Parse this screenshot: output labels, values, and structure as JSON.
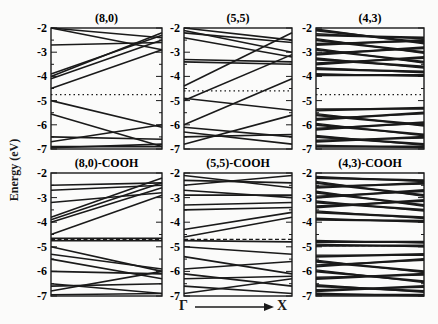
{
  "chart_data": {
    "type": "line",
    "title": "",
    "ylabel": "Energy (eV)",
    "xlabel": "Γ → X",
    "x_start_label": "Γ",
    "x_end_label": "X",
    "ylim": [
      -7,
      -2
    ],
    "yticks": [
      "-2",
      "-3",
      "-4",
      "-5",
      "-6",
      "-7"
    ],
    "grid": false,
    "panels": [
      {
        "title": "(8,0)",
        "fermi": -4.75,
        "fermi_style": "dotted",
        "bands": [
          [
            -2.7,
            -2.6
          ],
          [
            -3.9,
            -2.3
          ],
          [
            -4.0,
            -2.2
          ],
          [
            -4.1,
            -2.5
          ],
          [
            -4.5,
            -2.9
          ],
          [
            -2.0,
            -2.9
          ],
          [
            -2.0,
            -2.4
          ],
          [
            -5.0,
            -6.1
          ],
          [
            -5.55,
            -6.9
          ],
          [
            -6.5,
            -6.6
          ],
          [
            -6.7,
            -6.0
          ],
          [
            -6.9,
            -6.9
          ],
          [
            -6.95,
            -6.8
          ]
        ]
      },
      {
        "title": "(5,5)",
        "fermi": -4.6,
        "fermi_style": "dotted",
        "bands": [
          [
            -2.0,
            -2.5
          ],
          [
            -2.1,
            -3.0
          ],
          [
            -2.2,
            -2.6
          ],
          [
            -2.4,
            -3.2
          ],
          [
            -3.3,
            -3.4
          ],
          [
            -3.4,
            -3.5
          ],
          [
            -4.4,
            -2.2
          ],
          [
            -4.9,
            -5.4
          ],
          [
            -5.0,
            -3.1
          ],
          [
            -6.0,
            -4.1
          ],
          [
            -6.1,
            -6.5
          ],
          [
            -6.3,
            -6.8
          ],
          [
            -6.5,
            -6.4
          ],
          [
            -6.8,
            -5.6
          ]
        ]
      },
      {
        "title": "(4,3)",
        "fermi": -4.75,
        "fermi_style": "dotted",
        "dense": true,
        "bands": [
          [
            -2.3,
            -2.4
          ],
          [
            -2.5,
            -3.0
          ],
          [
            -2.7,
            -2.5
          ],
          [
            -2.9,
            -3.4
          ],
          [
            -3.1,
            -2.8
          ],
          [
            -3.3,
            -3.6
          ],
          [
            -3.5,
            -3.2
          ],
          [
            -3.7,
            -3.8
          ],
          [
            -3.95,
            -3.95
          ],
          [
            -2.1,
            -2.6
          ],
          [
            -5.4,
            -5.3
          ],
          [
            -5.6,
            -6.0
          ],
          [
            -5.8,
            -5.5
          ],
          [
            -6.0,
            -6.4
          ],
          [
            -6.2,
            -5.9
          ],
          [
            -6.5,
            -6.8
          ],
          [
            -6.7,
            -6.5
          ],
          [
            -6.9,
            -6.9
          ]
        ]
      },
      {
        "title": "(8,0)-COOH",
        "fermi": -4.7,
        "fermi_style": "dashed",
        "bands": [
          [
            -2.5,
            -2.4
          ],
          [
            -2.7,
            -2.5
          ],
          [
            -3.2,
            -2.8
          ],
          [
            -3.8,
            -2.2
          ],
          [
            -3.9,
            -2.4
          ],
          [
            -4.0,
            -2.6
          ],
          [
            -4.5,
            -2.9
          ],
          [
            -4.65,
            -4.65
          ],
          [
            -4.75,
            -4.75
          ],
          [
            -5.0,
            -6.0
          ],
          [
            -5.3,
            -5.9
          ],
          [
            -5.5,
            -6.3
          ],
          [
            -6.0,
            -6.1
          ],
          [
            -6.5,
            -6.9
          ],
          [
            -6.6,
            -6.5
          ],
          [
            -6.8,
            -6.0
          ],
          [
            -6.95,
            -6.9
          ]
        ]
      },
      {
        "title": "(5,5)-COOH",
        "fermi": -4.7,
        "fermi_style": "dashed",
        "bands": [
          [
            -2.1,
            -2.6
          ],
          [
            -2.3,
            -2.4
          ],
          [
            -2.5,
            -2.1
          ],
          [
            -2.7,
            -3.0
          ],
          [
            -2.9,
            -2.9
          ],
          [
            -3.3,
            -3.2
          ],
          [
            -3.5,
            -3.4
          ],
          [
            -4.3,
            -3.6
          ],
          [
            -4.6,
            -3.8
          ],
          [
            -4.75,
            -4.8
          ],
          [
            -5.0,
            -5.3
          ],
          [
            -5.4,
            -6.1
          ],
          [
            -5.9,
            -5.6
          ],
          [
            -6.1,
            -6.6
          ],
          [
            -6.3,
            -6.2
          ],
          [
            -6.6,
            -6.9
          ],
          [
            -6.9,
            -6.3
          ]
        ]
      },
      {
        "title": "(4,3)-COOH",
        "fermi": -4.95,
        "fermi_style": "dashed",
        "dense": true,
        "bands": [
          [
            -2.2,
            -2.3
          ],
          [
            -2.4,
            -2.9
          ],
          [
            -2.6,
            -2.4
          ],
          [
            -2.8,
            -3.3
          ],
          [
            -3.0,
            -2.7
          ],
          [
            -3.2,
            -3.5
          ],
          [
            -3.4,
            -3.1
          ],
          [
            -3.6,
            -3.8
          ],
          [
            -3.9,
            -3.95
          ],
          [
            -4.8,
            -4.8
          ],
          [
            -4.95,
            -4.95
          ],
          [
            -5.4,
            -5.3
          ],
          [
            -5.6,
            -6.0
          ],
          [
            -5.8,
            -5.5
          ],
          [
            -6.0,
            -6.4
          ],
          [
            -6.3,
            -6.1
          ],
          [
            -6.6,
            -6.8
          ],
          [
            -6.8,
            -6.6
          ],
          [
            -6.95,
            -6.95
          ]
        ]
      }
    ]
  },
  "axis": {
    "ylabel": "Energy (eV)",
    "gamma": "Γ",
    "x": "X"
  }
}
